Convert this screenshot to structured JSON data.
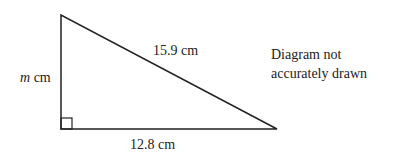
{
  "diagram": {
    "shape": "right-triangle",
    "vertices": {
      "top": [
        61,
        15
      ],
      "right_angle": [
        61,
        129
      ],
      "right": [
        277,
        129
      ]
    },
    "labels": {
      "vertical_side_var": "m",
      "vertical_side_unit": " cm",
      "hypotenuse": "15.9 cm",
      "base": "12.8 cm"
    },
    "note_line1": "Diagram not",
    "note_line2": "accurately drawn",
    "stroke_color": "#222222"
  }
}
